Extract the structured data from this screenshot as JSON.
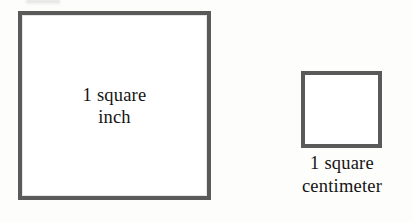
{
  "figure": {
    "kind": "geometry-comparison-diagram",
    "background_color": "#fdfdfc",
    "stroke_color": "#5a5a5a",
    "fill_color": "#ffffff",
    "text_color": "#141414",
    "shapes": [
      {
        "id": "square-inch",
        "shape": "square",
        "label_line1": "1 square",
        "label_line2": "inch",
        "label_position": "inside",
        "x": 18,
        "y": 11,
        "width": 193,
        "height": 189,
        "border_width": 4
      },
      {
        "id": "square-centimeter",
        "shape": "square",
        "label_line1": "1 square",
        "label_line2": "centimeter",
        "label_position": "below",
        "x": 301,
        "y": 71,
        "width": 81,
        "height": 77,
        "border_width": 4
      }
    ]
  }
}
